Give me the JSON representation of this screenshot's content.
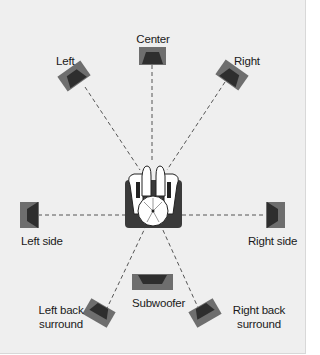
{
  "diagram": {
    "listener": "listener-seat",
    "speakers": [
      {
        "id": "center",
        "label": "Center"
      },
      {
        "id": "left",
        "label": "Left"
      },
      {
        "id": "right",
        "label": "Right"
      },
      {
        "id": "left_side",
        "label": "Left side"
      },
      {
        "id": "right_side",
        "label": "Right side"
      },
      {
        "id": "subwoofer",
        "label": "Subwoofer"
      },
      {
        "id": "left_back",
        "label_line1": "Left back",
        "label_line2": "surround"
      },
      {
        "id": "right_back",
        "label_line1": "Right back",
        "label_line2": "surround"
      }
    ],
    "colors": {
      "background": "#efefef",
      "speaker_body": "#6e6e6e",
      "speaker_cone": "#2e2e2e",
      "line": "#555555",
      "seat": "#3a3a3a"
    }
  }
}
